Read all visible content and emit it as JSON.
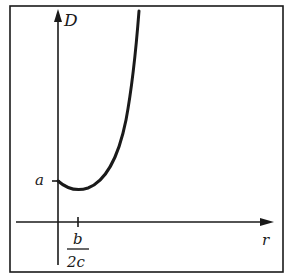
{
  "diagram": {
    "type": "function-graph",
    "y_axis": {
      "label": "D"
    },
    "x_axis": {
      "label": "r"
    },
    "y_tick": {
      "label": "a"
    },
    "x_tick": {
      "numerator": "b",
      "denominator": "2c"
    },
    "curve": {
      "description": "U-shaped curve starting at D=a on the D axis, dipping to a minimum near r=b/2c, then rising steeply"
    },
    "colors": {
      "stroke": "#1a1a1a",
      "background": "#ffffff"
    }
  }
}
